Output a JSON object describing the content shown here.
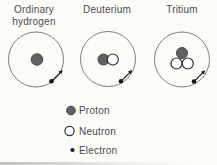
{
  "atoms": [
    {
      "id": "ordinary-hydrogen",
      "label_lines": [
        "Ordinary",
        "hydrogen"
      ],
      "protons": 1,
      "neutrons": 0,
      "electrons": 1
    },
    {
      "id": "deuterium",
      "label_lines": [
        "Deuterium"
      ],
      "protons": 1,
      "neutrons": 1,
      "electrons": 1
    },
    {
      "id": "tritium",
      "label_lines": [
        "Tritium"
      ],
      "protons": 1,
      "neutrons": 2,
      "electrons": 1
    }
  ],
  "legend": {
    "items": [
      {
        "symbol": "proton-marker",
        "label": "Proton"
      },
      {
        "symbol": "neutron-marker",
        "label": "Neutron"
      },
      {
        "symbol": "electron-marker",
        "label": "Electron"
      }
    ]
  },
  "colors": {
    "background": "#fbfbf8",
    "proton_fill": "#616161",
    "proton_stroke": "#3a3a3a",
    "neutron_fill": "#ffffff",
    "neutron_stroke": "#2f2f2f",
    "electron": "#151515",
    "orbit": "#7f7f7f",
    "text": "#4b4b4b"
  }
}
